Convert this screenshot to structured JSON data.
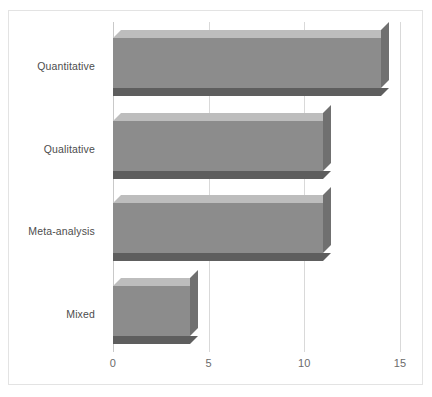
{
  "chart_data": {
    "type": "bar",
    "orientation": "horizontal",
    "style": "3d",
    "title": "",
    "subtitle": "",
    "xlabel": "",
    "ylabel": "",
    "categories": [
      "Quantitative",
      "Qualitative",
      "Meta-analysis",
      "Mixed"
    ],
    "values": [
      14,
      11,
      11,
      4
    ],
    "series": [
      {
        "name": "",
        "values": [
          14,
          11,
          11,
          4
        ]
      }
    ],
    "xlim": [
      0,
      15
    ],
    "xticks": [
      0,
      5,
      10,
      15
    ],
    "xtick_labels": [
      "0",
      "5",
      "10",
      "15"
    ],
    "grid": true,
    "grid_axis": "x",
    "legend": false,
    "legend_position": "none",
    "annotations": [],
    "colors": {
      "bar_front": "#8c8c8c",
      "bar_top": "#bdbdbd",
      "bar_side": "#707070",
      "bar_shadow": "#5e5e5e",
      "gridline": "#d9d9d9",
      "axis": "#c9c9c9",
      "frame": "#e3e3e3",
      "background": "#ffffff",
      "tick_text": "#6b6b6b",
      "category_text": "#4d4d4d"
    }
  }
}
